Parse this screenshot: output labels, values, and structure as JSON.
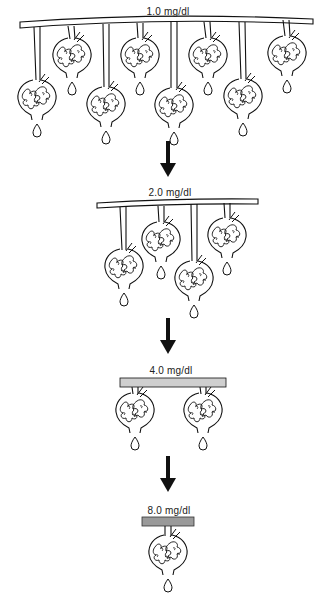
{
  "diagram": {
    "type": "nephron-loss-illustration",
    "stages": [
      {
        "label": "1.0 mg/dl",
        "nephron_count": 8,
        "vessel_style": "thin-curved"
      },
      {
        "label": "2.0 mg/dl",
        "nephron_count": 4,
        "vessel_style": "thin-curved"
      },
      {
        "label": "4.0 mg/dl",
        "nephron_count": 2,
        "vessel_style": "thick-gray"
      },
      {
        "label": "8.0 mg/dl",
        "nephron_count": 1,
        "vessel_style": "thick-dark-gray"
      }
    ],
    "arrows": 3,
    "colors": {
      "line": "#111111",
      "vessel_fill": "#ffffff",
      "vessel_gray": "#cfcfcf",
      "vessel_dark": "#9a9a9a"
    }
  }
}
